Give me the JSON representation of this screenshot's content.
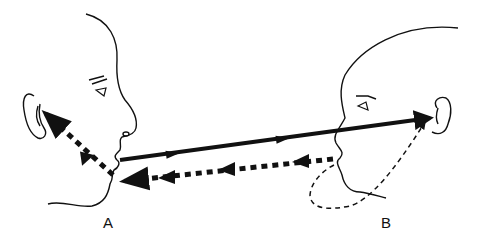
{
  "labels": {
    "person_a": "A",
    "person_b": "B"
  },
  "colors": {
    "ink": "#111111",
    "background": "#ffffff"
  },
  "paths": {
    "direct_speech": "solid arrow from A's mouth to B's ear",
    "reply_to_a": "heavy dotted arrow from B's mouth to A's mouth",
    "a_self_feedback": "heavy dotted arrow from A's mouth to A's ear",
    "b_self_feedback": "thin dashed loop from B's mouth around chin to B's ear"
  }
}
